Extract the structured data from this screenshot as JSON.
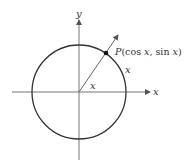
{
  "diagram": {
    "type": "unit-circle",
    "axes": {
      "x_label": "x",
      "y_label": "y"
    },
    "point": {
      "label_prefix": "P",
      "label_coords": "(cos x, sin x)",
      "label_cos": "(cos ",
      "label_x1": "x",
      "label_mid": ", sin ",
      "label_x2": "x",
      "label_close": ")"
    },
    "angle_label": "x",
    "arc_label": "x",
    "colors": {
      "stroke": "#333333",
      "axis": "#777777",
      "text": "#333333"
    }
  }
}
